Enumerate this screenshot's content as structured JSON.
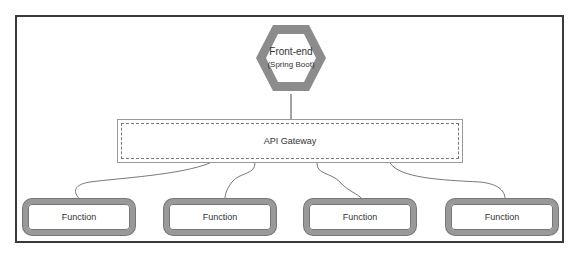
{
  "diagram": {
    "frontend": {
      "title": "Front-end",
      "subtitle": "(Spring Boot)"
    },
    "gateway": {
      "label": "API Gateway"
    },
    "functions": [
      {
        "label": "Function"
      },
      {
        "label": "Function"
      },
      {
        "label": "Function"
      },
      {
        "label": "Function"
      }
    ],
    "colors": {
      "frame": "#3a3a3a",
      "hexagon": "#8c8c8c",
      "function_border": "#999999",
      "text": "#333333"
    }
  }
}
